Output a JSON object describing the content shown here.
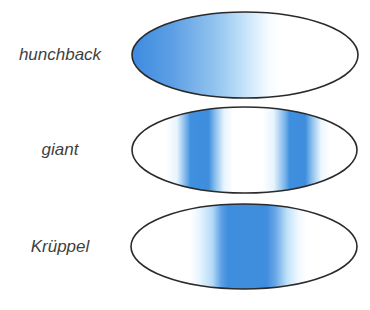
{
  "figure": {
    "kind": "Drosophila embryo gap gene expression patterns",
    "colors": {
      "expression": "#3f8ddd",
      "outline": "#2a2a2a",
      "background": "#ffffff",
      "label": "#3f3f3f"
    }
  },
  "embryos": [
    {
      "label": "hunchback",
      "pattern": "anterior gradient (strong at left, fading toward middle)"
    },
    {
      "label": "giant",
      "pattern": "two stripes (anterior and posterior)"
    },
    {
      "label": "Krüppel",
      "pattern": "single broad central band"
    }
  ]
}
